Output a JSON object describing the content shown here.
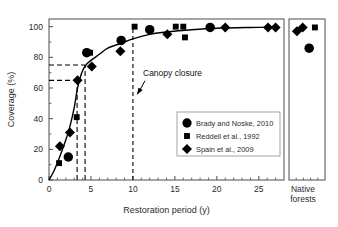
{
  "chart_data": {
    "type": "scatter",
    "title": "",
    "xlabel": "Restoration period (y)",
    "ylabel": "Coverage (%)",
    "xlim": [
      0,
      28
    ],
    "ylim": [
      0,
      105
    ],
    "x_ticks": [
      0,
      5,
      10,
      15,
      20,
      25
    ],
    "x_tick_labels": [
      "0",
      "5",
      "10",
      "15",
      "20",
      "25"
    ],
    "y_ticks": [
      0,
      20,
      40,
      60,
      80,
      100
    ],
    "y_tick_labels": [
      "0",
      "20",
      "40",
      "60",
      "80",
      "100"
    ],
    "grid": false,
    "legend_position": "lower right",
    "legend": [
      {
        "label": "Brady and Noske, 2010",
        "marker": "circle"
      },
      {
        "label": "Reddell et al., 1992",
        "marker": "square"
      },
      {
        "label": "Spain et al., 2009",
        "marker": "diamond"
      }
    ],
    "series": [
      {
        "name": "Brady and Noske, 2010",
        "marker": "circle",
        "points": [
          {
            "x": 2.3,
            "y": 15
          },
          {
            "x": 4.5,
            "y": 83
          },
          {
            "x": 8.6,
            "y": 91
          },
          {
            "x": 12.0,
            "y": 98
          },
          {
            "x": 19.2,
            "y": 99.5
          }
        ]
      },
      {
        "name": "Reddell et al., 1992",
        "marker": "square",
        "points": [
          {
            "x": 1.2,
            "y": 11
          },
          {
            "x": 3.3,
            "y": 41
          },
          {
            "x": 4.9,
            "y": 83
          },
          {
            "x": 10.2,
            "y": 100
          },
          {
            "x": 15.1,
            "y": 100
          },
          {
            "x": 16.0,
            "y": 100
          },
          {
            "x": 16.2,
            "y": 93
          }
        ]
      },
      {
        "name": "Spain et al., 2009",
        "marker": "diamond",
        "points": [
          {
            "x": 1.3,
            "y": 22
          },
          {
            "x": 2.5,
            "y": 31
          },
          {
            "x": 3.4,
            "y": 65
          },
          {
            "x": 5.1,
            "y": 74
          },
          {
            "x": 8.5,
            "y": 84
          },
          {
            "x": 14.1,
            "y": 95
          },
          {
            "x": 21.0,
            "y": 99.5
          },
          {
            "x": 26.1,
            "y": 99.5
          },
          {
            "x": 27.0,
            "y": 99.5
          }
        ]
      }
    ],
    "fit_curve": {
      "name": "fitted saturating curve",
      "points": [
        {
          "x": 0.0,
          "y": 0
        },
        {
          "x": 0.6,
          "y": 6
        },
        {
          "x": 1.2,
          "y": 14
        },
        {
          "x": 1.8,
          "y": 23
        },
        {
          "x": 2.4,
          "y": 33
        },
        {
          "x": 3.0,
          "y": 47
        },
        {
          "x": 3.4,
          "y": 60
        },
        {
          "x": 3.9,
          "y": 70
        },
        {
          "x": 4.4,
          "y": 75
        },
        {
          "x": 5.0,
          "y": 78
        },
        {
          "x": 6.0,
          "y": 82
        },
        {
          "x": 7.0,
          "y": 86
        },
        {
          "x": 8.5,
          "y": 89
        },
        {
          "x": 10.0,
          "y": 92
        },
        {
          "x": 12.0,
          "y": 95
        },
        {
          "x": 14.0,
          "y": 96.5
        },
        {
          "x": 17.0,
          "y": 98
        },
        {
          "x": 20.0,
          "y": 99
        },
        {
          "x": 24.0,
          "y": 99.5
        },
        {
          "x": 27.2,
          "y": 99.7
        }
      ]
    },
    "guide_lines": [
      {
        "type": "horizontal",
        "y": 75,
        "x_from": 0,
        "x_to": 4.3,
        "style": "dashed"
      },
      {
        "type": "horizontal",
        "y": 65,
        "x_from": 0,
        "x_to": 3.4,
        "style": "dashed"
      },
      {
        "type": "vertical",
        "x": 3.35,
        "y_from": 0,
        "y_to": 65,
        "style": "dashed"
      },
      {
        "type": "vertical",
        "x": 4.3,
        "y_from": 0,
        "y_to": 75,
        "style": "dashed"
      }
    ],
    "annotations": [
      {
        "text": "Canopy closure",
        "x": 11.2,
        "y": 68,
        "arrow_to_x": 10.0,
        "arrow_to_y": 55
      }
    ],
    "canopy_closure_line": {
      "x": 10.0,
      "y_from": 0,
      "y_to": 100,
      "style": "dashed"
    },
    "side_panel": {
      "label_line1": "Native",
      "label_line2": "forests",
      "points": [
        {
          "series": "Spain et al., 2009",
          "marker": "diamond",
          "slot": 0.22,
          "y": 97
        },
        {
          "series": "Spain et al., 2009",
          "marker": "diamond",
          "slot": 0.38,
          "y": 99.5
        },
        {
          "series": "Reddell et al., 1992",
          "marker": "square",
          "slot": 0.72,
          "y": 99.5
        },
        {
          "series": "Brady and Noske, 2010",
          "marker": "circle",
          "slot": 0.56,
          "y": 86
        }
      ]
    },
    "colors": {
      "marker": "#000000",
      "curve": "#000000",
      "axis": "#4d4d4d",
      "background": "#ffffff"
    }
  }
}
